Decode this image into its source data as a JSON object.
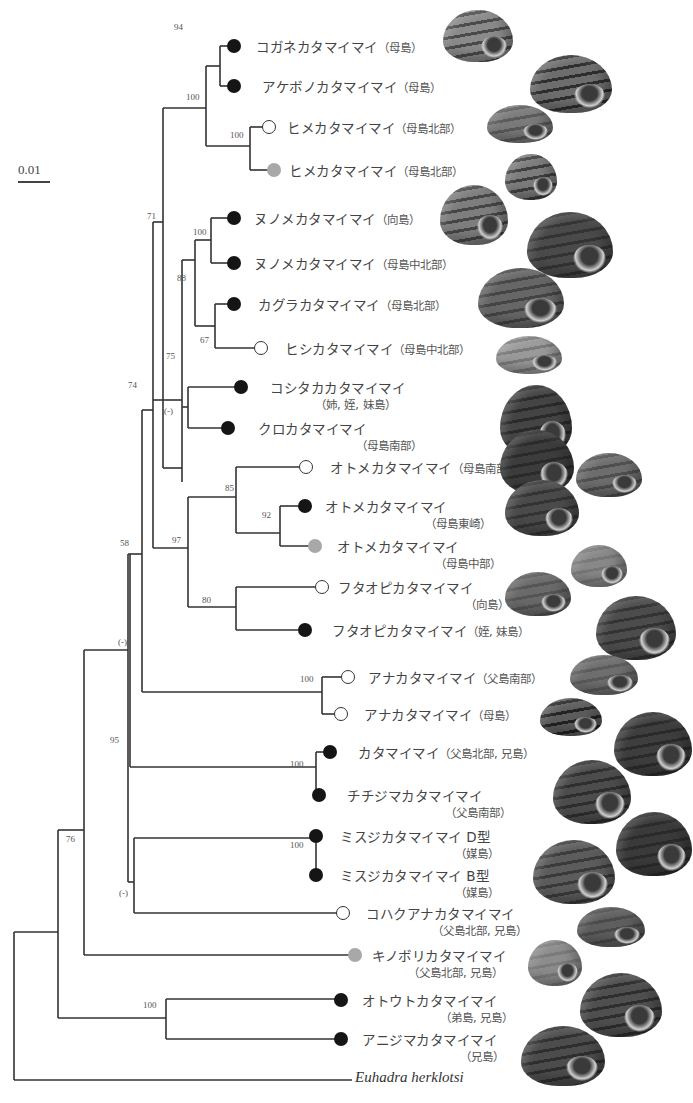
{
  "scale": {
    "label": "0.01"
  },
  "support": [
    {
      "label": "94",
      "x": 174,
      "y": 22
    },
    {
      "label": "100",
      "x": 186,
      "y": 92
    },
    {
      "label": "100",
      "x": 230,
      "y": 130
    },
    {
      "label": "71",
      "x": 147,
      "y": 211
    },
    {
      "label": "100",
      "x": 193,
      "y": 227
    },
    {
      "label": "88",
      "x": 177,
      "y": 273
    },
    {
      "label": "67",
      "x": 200,
      "y": 335
    },
    {
      "label": "75",
      "x": 166,
      "y": 351
    },
    {
      "label": "(-)",
      "x": 164,
      "y": 406
    },
    {
      "label": "74",
      "x": 128,
      "y": 380
    },
    {
      "label": "85",
      "x": 225,
      "y": 483
    },
    {
      "label": "92",
      "x": 262,
      "y": 510
    },
    {
      "label": "97",
      "x": 172,
      "y": 535
    },
    {
      "label": "80",
      "x": 202,
      "y": 595
    },
    {
      "label": "58",
      "x": 120,
      "y": 538
    },
    {
      "label": "(-)",
      "x": 118,
      "y": 637
    },
    {
      "label": "100",
      "x": 300,
      "y": 674
    },
    {
      "label": "95",
      "x": 110,
      "y": 735
    },
    {
      "label": "100",
      "x": 290,
      "y": 759
    },
    {
      "label": "100",
      "x": 290,
      "y": 840
    },
    {
      "label": "(-)",
      "x": 119,
      "y": 888
    },
    {
      "label": "76",
      "x": 66,
      "y": 834
    },
    {
      "label": "100",
      "x": 143,
      "y": 1000
    }
  ],
  "tips": [
    {
      "name": "コガネカタマイマイ",
      "loc": "（母島）",
      "sub": "",
      "dot": "black",
      "dot_x": 234,
      "y": 46,
      "label_x": 256
    },
    {
      "name": "アケボノカタマイマイ",
      "loc": "（母島）",
      "sub": "",
      "dot": "black",
      "dot_x": 234,
      "y": 86,
      "label_x": 262
    },
    {
      "name": "ヒメカタマイマイ",
      "loc": "（母島北部）",
      "sub": "",
      "dot": "white",
      "dot_x": 269,
      "y": 127,
      "label_x": 287
    },
    {
      "name": "ヒメカタマイマイ",
      "loc": "（母島北部）",
      "sub": "",
      "dot": "gray",
      "dot_x": 274,
      "y": 170,
      "label_x": 289
    },
    {
      "name": "ヌノメカタマイマイ",
      "loc": "（向島）",
      "sub": "",
      "dot": "black",
      "dot_x": 234,
      "y": 218,
      "label_x": 254
    },
    {
      "name": "ヌノメカタマイマイ",
      "loc": "（母島中北部）",
      "sub": "",
      "dot": "black",
      "dot_x": 234,
      "y": 263,
      "label_x": 254
    },
    {
      "name": "カグラカタマイマイ",
      "loc": "（母島北部）",
      "sub": "",
      "dot": "black",
      "dot_x": 234,
      "y": 304,
      "label_x": 258
    },
    {
      "name": "ヒシカタマイマイ",
      "loc": "（母島中北部）",
      "sub": "",
      "dot": "white",
      "dot_x": 261,
      "y": 348,
      "label_x": 285
    },
    {
      "name": "コシタカカタマイマイ",
      "loc": "",
      "sub": "（姉, 姪, 妹島）",
      "sub_x": 315,
      "dot": "black",
      "dot_x": 241,
      "y": 387,
      "label_x": 270
    },
    {
      "name": "クロカタマイマイ",
      "loc": "",
      "sub": "（母島南部）",
      "sub_x": 356,
      "dot": "black",
      "dot_x": 228,
      "y": 428,
      "label_x": 258
    },
    {
      "name": "オトメカタマイマイ",
      "loc": "（母島南部）",
      "sub": "",
      "dot": "white",
      "dot_x": 306,
      "y": 467,
      "label_x": 330
    },
    {
      "name": "オトメカタマイマイ",
      "loc": "",
      "sub": "（母島東崎）",
      "sub_x": 425,
      "dot": "black",
      "dot_x": 305,
      "y": 506,
      "label_x": 325
    },
    {
      "name": "オトメカタマイマイ",
      "loc": "",
      "sub": "（母島中部）",
      "sub_x": 435,
      "dot": "gray",
      "dot_x": 315,
      "y": 546,
      "label_x": 337
    },
    {
      "name": "フタオピカタマイマイ",
      "loc": "",
      "sub": "（向島）",
      "sub_x": 465,
      "dot": "white",
      "dot_x": 322,
      "y": 587,
      "label_x": 338
    },
    {
      "name": "フタオピカタマイマイ",
      "loc": "（姪, 妹島）",
      "sub": "",
      "dot": "black",
      "dot_x": 305,
      "y": 630,
      "label_x": 332
    },
    {
      "name": "アナカタマイマイ",
      "loc": "（父島南部）",
      "sub": "",
      "dot": "white",
      "dot_x": 348,
      "y": 677,
      "label_x": 368
    },
    {
      "name": "アナカタマイマイ",
      "loc": "（母島）",
      "sub": "",
      "dot": "white",
      "dot_x": 341,
      "y": 714,
      "label_x": 364
    },
    {
      "name": "カタマイマイ",
      "loc": "（父島北部, 兄島）",
      "sub": "",
      "dot": "black",
      "dot_x": 330,
      "y": 752,
      "label_x": 358
    },
    {
      "name": "チチジマカタマイマイ",
      "loc": "",
      "sub": "（父島南部）",
      "sub_x": 445,
      "dot": "black",
      "dot_x": 319,
      "y": 795,
      "label_x": 347
    },
    {
      "name": "ミスジカタマイマイ D型",
      "loc": "",
      "sub": "（媒島）",
      "sub_x": 455,
      "dot": "black",
      "dot_x": 316,
      "y": 836,
      "label_x": 340
    },
    {
      "name": "ミスジカタマイマイ B型",
      "loc": "",
      "sub": "（媒島）",
      "sub_x": 455,
      "dot": "black",
      "dot_x": 316,
      "y": 875,
      "label_x": 340
    },
    {
      "name": "コハクアナカタマイマイ",
      "loc": "",
      "sub": "（父島北部, 兄島）",
      "sub_x": 432,
      "dot": "white",
      "dot_x": 343,
      "y": 913,
      "label_x": 366
    },
    {
      "name": "キノボリカタマイマイ",
      "loc": "",
      "sub": "（父島北部, 兄島）",
      "sub_x": 408,
      "dot": "gray",
      "dot_x": 355,
      "y": 955,
      "label_x": 372
    },
    {
      "name": "オトウトカタマイマイ",
      "loc": "",
      "sub": "（弟島, 兄島）",
      "sub_x": 440,
      "dot": "black",
      "dot_x": 341,
      "y": 1000,
      "label_x": 362
    },
    {
      "name": "アニジマカタマイマイ",
      "loc": "",
      "sub": "（兄島）",
      "sub_x": 460,
      "dot": "black",
      "dot_x": 341,
      "y": 1039,
      "label_x": 362
    }
  ],
  "outgroup": {
    "name": "Euhadra herklotsi",
    "x": 355,
    "y": 1078
  },
  "branches": [
    "M14,1080 V932",
    "M14,1080 H352",
    "M14,932 H58",
    "M58,830 V1018",
    "M58,1018 H166",
    "M166,999 V1039",
    "M166,999 H341",
    "M166,1039 H341",
    "M58,830 H84",
    "M84,650 V955",
    "M84,955 H355",
    "M84,650 H128",
    "M128,554 V882",
    "M128,882 H134",
    "M134,838 V913",
    "M134,838 H316",
    "M134,913 H343",
    "M316,831 V875",
    "M316,831 H316",
    "M128,554 H130",
    "M130,554 V767",
    "M130,767 H316",
    "M316,752 V795",
    "M316,752 H330",
    "M316,795 H319",
    "M130,554 H142",
    "M142,410 V692",
    "M142,692 H322",
    "M322,677 V714",
    "M322,677 H348",
    "M322,714 H341",
    "M142,410 H153",
    "M153,222 V548",
    "M153,548 H188",
    "M188,497 V607",
    "M188,497 H236",
    "M236,467 V533",
    "M236,467 H306",
    "M236,533 H280",
    "M280,506 V546",
    "M280,506 H305",
    "M280,546 H315",
    "M188,607 H236",
    "M236,587 V630",
    "M236,587 H322",
    "M236,630 H305",
    "M153,222 H163",
    "M163,108 V468",
    "M163,108 H206",
    "M206,66 V146",
    "M206,66 H220",
    "M220,46 V86",
    "M220,46 H234",
    "M220,86 H234",
    "M206,146 H250",
    "M250,127 V170",
    "M250,127 H269",
    "M250,170 H274",
    "M163,468 H182",
    "M182,400 V482",
    "M153,400 H182",
    "M182,400 V360",
    "M182,360 V260",
    "M182,260 H195",
    "M195,240 V326",
    "M195,240 H211",
    "M211,218 V263",
    "M211,218 H234",
    "M211,263 H234",
    "M195,326 H215",
    "M215,304 V348",
    "M215,304 H234",
    "M215,348 H261",
    "M182,407 H188",
    "M188,387 V428",
    "M188,387 H241",
    "M188,428 H228"
  ],
  "shells": [
    {
      "x": 443,
      "y": 10,
      "w": 70,
      "h": 52,
      "tone": "#8a8a8a",
      "band": "#4a4a4a"
    },
    {
      "x": 530,
      "y": 55,
      "w": 82,
      "h": 58,
      "tone": "#6d6d6d",
      "band": "#2e2e2e"
    },
    {
      "x": 487,
      "y": 105,
      "w": 66,
      "h": 38,
      "tone": "#7a7a7a",
      "band": "#5a5a5a"
    },
    {
      "x": 505,
      "y": 154,
      "w": 52,
      "h": 46,
      "tone": "#7c7c7c",
      "band": "#3e3e3e"
    },
    {
      "x": 440,
      "y": 185,
      "w": 68,
      "h": 60,
      "tone": "#7d7d7d",
      "band": "#454545"
    },
    {
      "x": 527,
      "y": 212,
      "w": 86,
      "h": 66,
      "tone": "#4a4a4a",
      "band": "#333333"
    },
    {
      "x": 478,
      "y": 268,
      "w": 86,
      "h": 60,
      "tone": "#666666",
      "band": "#444444"
    },
    {
      "x": 496,
      "y": 336,
      "w": 66,
      "h": 38,
      "tone": "#9a9a9a",
      "band": "#7a7a7a"
    },
    {
      "x": 500,
      "y": 385,
      "w": 72,
      "h": 72,
      "tone": "#444444",
      "band": "#2a2a2a"
    },
    {
      "x": 500,
      "y": 430,
      "w": 74,
      "h": 64,
      "tone": "#3c3c3c",
      "band": "#2a2a2a"
    },
    {
      "x": 576,
      "y": 453,
      "w": 66,
      "h": 44,
      "tone": "#6d6d6d",
      "band": "#4e4e4e"
    },
    {
      "x": 505,
      "y": 480,
      "w": 74,
      "h": 56,
      "tone": "#4a4a4a",
      "band": "#333333"
    },
    {
      "x": 571,
      "y": 545,
      "w": 56,
      "h": 42,
      "tone": "#888888",
      "band": "#777777"
    },
    {
      "x": 505,
      "y": 572,
      "w": 66,
      "h": 44,
      "tone": "#6a6a6a",
      "band": "#555555"
    },
    {
      "x": 596,
      "y": 596,
      "w": 80,
      "h": 64,
      "tone": "#4c4c4c",
      "band": "#333333"
    },
    {
      "x": 570,
      "y": 655,
      "w": 68,
      "h": 40,
      "tone": "#6e6e6e",
      "band": "#5a5a5a"
    },
    {
      "x": 540,
      "y": 698,
      "w": 62,
      "h": 38,
      "tone": "#5c5c5c",
      "band": "#222222"
    },
    {
      "x": 614,
      "y": 712,
      "w": 78,
      "h": 64,
      "tone": "#3e3e3e",
      "band": "#2a2a2a"
    },
    {
      "x": 553,
      "y": 760,
      "w": 78,
      "h": 64,
      "tone": "#4c4c4c",
      "band": "#2e2e2e"
    },
    {
      "x": 616,
      "y": 812,
      "w": 76,
      "h": 64,
      "tone": "#3a3a3a",
      "band": "#2a2a2a"
    },
    {
      "x": 533,
      "y": 840,
      "w": 82,
      "h": 64,
      "tone": "#5c5c5c",
      "band": "#3a3a3a"
    },
    {
      "x": 577,
      "y": 907,
      "w": 68,
      "h": 40,
      "tone": "#5e5e5e",
      "band": "#4a4a4a"
    },
    {
      "x": 528,
      "y": 940,
      "w": 54,
      "h": 46,
      "tone": "#8c8c8c",
      "band": "#7a7a7a"
    },
    {
      "x": 580,
      "y": 973,
      "w": 82,
      "h": 64,
      "tone": "#4f4f4f",
      "band": "#2e2e2e"
    },
    {
      "x": 521,
      "y": 1026,
      "w": 84,
      "h": 60,
      "tone": "#4c4c4c",
      "band": "#2e2e2e"
    }
  ]
}
